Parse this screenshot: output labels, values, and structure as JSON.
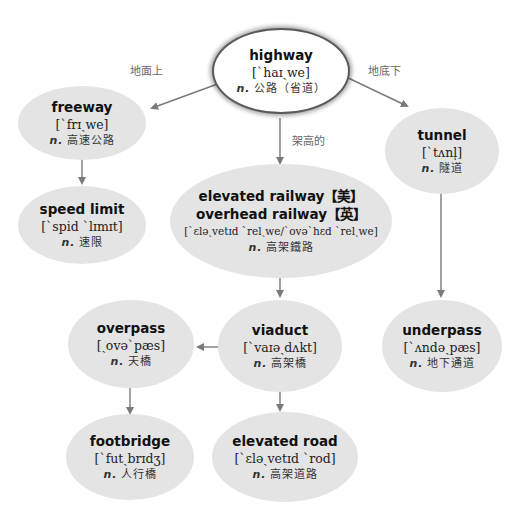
{
  "diagram": {
    "colors": {
      "node_fill": "#e4e4e4",
      "root_fill": "#ffffff",
      "root_border": "#5a5a5a",
      "arrow": "#7a7a7a",
      "label": "#666666"
    },
    "edge_labels": {
      "above_ground": "地面上",
      "underground": "地底下",
      "elevated": "架高的"
    },
    "nodes": {
      "highway": {
        "word": "highway",
        "ipa": "[ˋhaɪˏwe]",
        "pos": "n.",
        "cn": "公路（省道）"
      },
      "freeway": {
        "word": "freeway",
        "ipa": "[ˋfrɪˏwe]",
        "pos": "n.",
        "cn": "高速公路"
      },
      "tunnel": {
        "word": "tunnel",
        "ipa": "[ˋtʌnl̩]",
        "pos": "n.",
        "cn": "隧道"
      },
      "speed_limit": {
        "word": "speed limit",
        "ipa": "[ˋspid ˋlɪmɪt]",
        "pos": "n.",
        "cn": "速限"
      },
      "elevated_railway": {
        "word_us": "elevated railway【美】",
        "word_uk": "overhead railway【英】",
        "ipa": "[ˋɛləˏvetɪd ˋrelˏwe/ˋovəˋhɛd ˋrelˏwe]",
        "pos": "n.",
        "cn": "高架鐵路"
      },
      "overpass": {
        "word": "overpass",
        "ipa": "[ˏovəˋpæs]",
        "pos": "n.",
        "cn": "天橋"
      },
      "viaduct": {
        "word": "viaduct",
        "ipa": "[ˋvaɪəˏdʌkt]",
        "pos": "n.",
        "cn": "高架橋"
      },
      "underpass": {
        "word": "underpass",
        "ipa": "[ˋʌndəˏpæs]",
        "pos": "n.",
        "cn": "地下通道"
      },
      "footbridge": {
        "word": "footbridge",
        "ipa": "[ˋfutˏbrɪdʒ]",
        "pos": "n.",
        "cn": "人行橋"
      },
      "elevated_road": {
        "word": "elevated road",
        "ipa": "[ˋɛləˏvetɪd ˋrod]",
        "pos": "n.",
        "cn": "高架道路"
      }
    }
  }
}
